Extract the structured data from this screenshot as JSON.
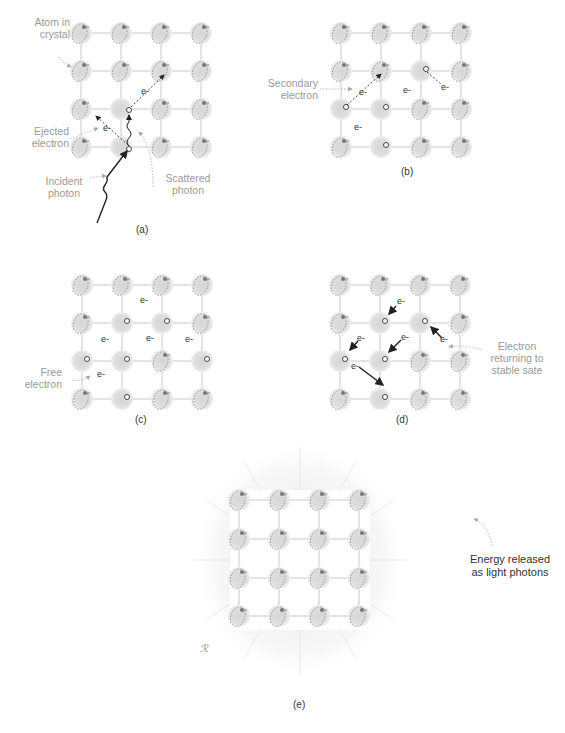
{
  "figure": {
    "colors": {
      "atom_fill": "#d9d9d9",
      "atom_outline": "#8a8a8a",
      "lattice_line": "#c8c8c8",
      "electron_text": "#333333",
      "arrow": "#222222",
      "label_text": "#9a9a9a",
      "glow": "#ececec"
    },
    "electron_symbol": "e-",
    "panels": [
      {
        "id": "a",
        "caption": "(a)",
        "labels": {
          "atom": "Atom in\ncrystal",
          "ejected": "Ejected\nelectron",
          "incident": "Incident\nphoton",
          "scattered": "Scattered\nphoton"
        }
      },
      {
        "id": "b",
        "caption": "(b)",
        "labels": {
          "secondary": "Secondary\nelectron"
        }
      },
      {
        "id": "c",
        "caption": "(c)",
        "labels": {
          "free": "Free\nelectron"
        }
      },
      {
        "id": "d",
        "caption": "(d)",
        "labels": {
          "returning": "Electron\nreturning to\nstable sate"
        }
      },
      {
        "id": "e",
        "caption": "(e)",
        "labels": {
          "energy": "Energy released\nas light photons"
        }
      }
    ]
  }
}
